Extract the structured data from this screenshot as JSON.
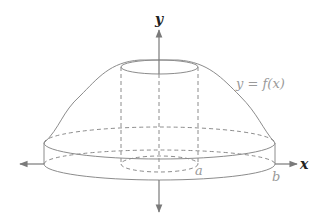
{
  "diagram": {
    "type": "solid-of-revolution",
    "labels": {
      "y_axis": "y",
      "x_axis": "x",
      "curve": "y = f(x)",
      "inner_radius": "a",
      "outer_radius": "b"
    },
    "colors": {
      "stroke": "#8c8c8c",
      "axis": "#7a7a7a",
      "axis_label": "#222222",
      "label": "#9a9a9a",
      "background": "#ffffff"
    }
  }
}
